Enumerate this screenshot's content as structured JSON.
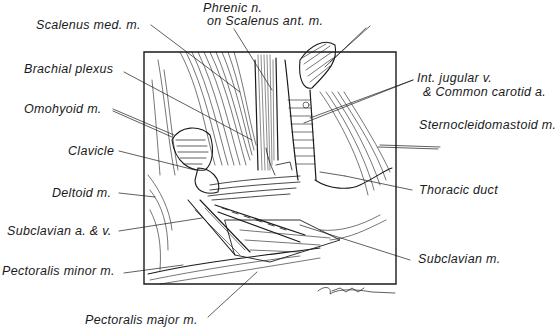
{
  "figure": {
    "type": "anatomical-illustration",
    "signature": "Gardner"
  },
  "labels": {
    "scalenus_med": "Scalenus med. m.",
    "phrenic_1": "Phrenic n.",
    "phrenic_2": "on Scalenus ant. m.",
    "brachial_plexus": "Brachial plexus",
    "omohyoid": "Omohyoid m.",
    "clavicle": "Clavicle",
    "deltoid": "Deltoid m.",
    "subclavian_av": "Subclavian a. & v.",
    "pectoralis_minor": "Pectoralis minor m.",
    "pectoralis_major": "Pectoralis major m.",
    "int_jugular_1": "Int. jugular v.",
    "int_jugular_2": "& Common carotid a.",
    "sternocleidomastoid": "Sternocleidomastoid m.",
    "thoracic_duct": "Thoracic duct",
    "subclavian_m": "Subclavian m."
  },
  "colors": {
    "ink": "#1a1a1a",
    "background": "#ffffff"
  }
}
